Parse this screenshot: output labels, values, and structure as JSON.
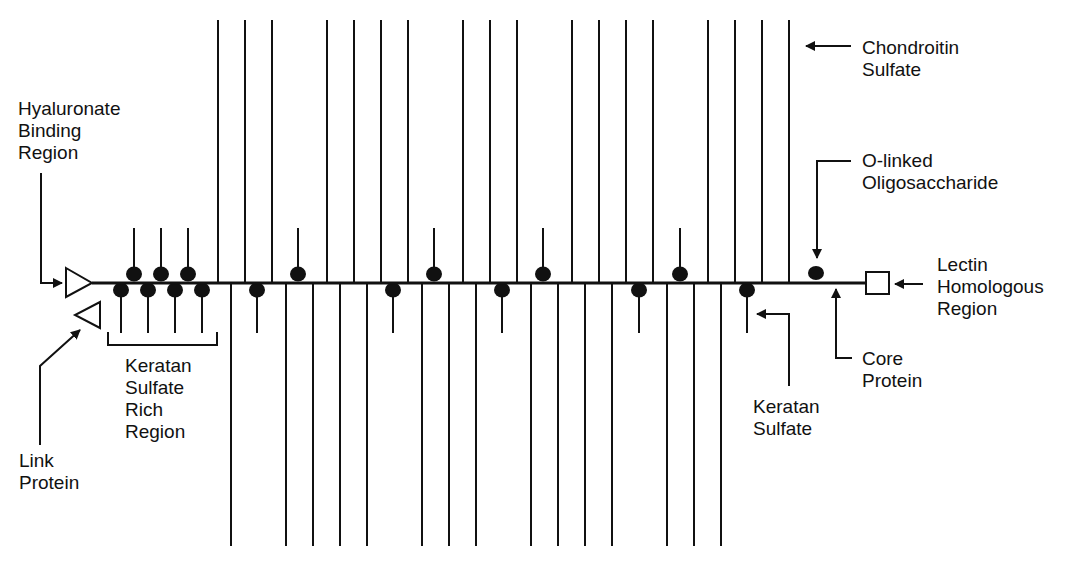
{
  "diagram": {
    "colors": {
      "ink": "#111111",
      "background": "#ffffff"
    },
    "core_protein": {
      "x1": 92,
      "x2": 866,
      "y": 283
    },
    "labels": {
      "hyaluronate_binding_region": "Hyaluronate\nBinding\nRegion",
      "link_protein": "Link\nProtein",
      "keratan_sulfate_rich_region": "Keratan\nSulfate\nRich\nRegion",
      "chondroitin_sulfate": "Chondroitin\nSulfate",
      "o_linked_oligosaccharide": "O-linked\nOligosaccharide",
      "lectin_homologous_region": "Lectin\nHomologous\nRegion",
      "core_protein": "Core\nProtein",
      "keratan_sulfate": "Keratan\nSulfate"
    },
    "chondroitin_sulfate_chains": {
      "up": {
        "y_top": 20,
        "x": [
          218,
          245,
          272,
          327,
          354,
          381,
          408,
          463,
          490,
          517,
          572,
          599,
          626,
          653,
          708,
          735,
          762,
          789
        ]
      },
      "down": {
        "y_bottom": 546,
        "x": [
          231,
          286,
          313,
          340,
          367,
          422,
          449,
          476,
          531,
          558,
          585,
          612,
          667,
          694,
          721
        ]
      }
    },
    "keratan_sulfate_chains": {
      "up": {
        "y_top": 228,
        "x": [
          134,
          161,
          188,
          298,
          434,
          543,
          680
        ]
      },
      "down": {
        "y_bottom": 333,
        "x": [
          121,
          148,
          175,
          202,
          257,
          393,
          502,
          639,
          747
        ]
      }
    },
    "o_linked_oligosaccharide": {
      "x": 816
    },
    "bracket": {
      "x1": 108,
      "x2": 217,
      "y": 345
    }
  }
}
